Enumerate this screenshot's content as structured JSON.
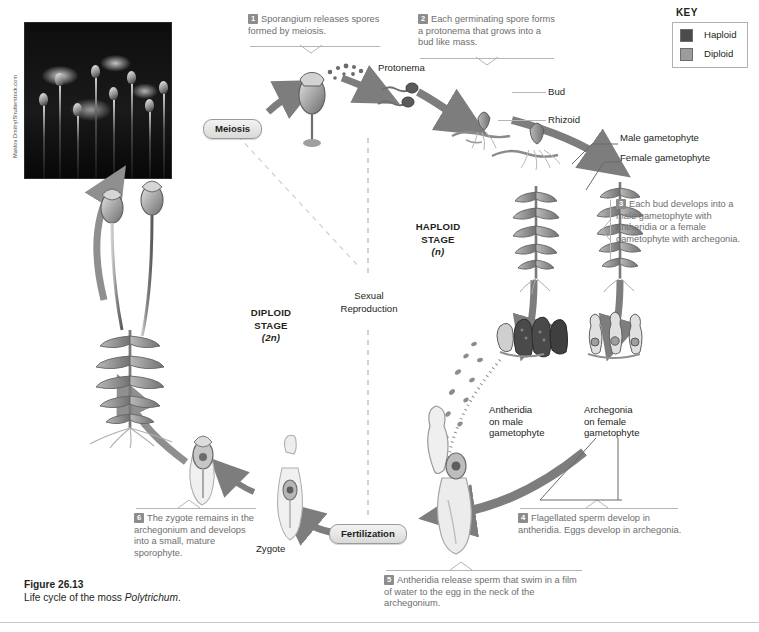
{
  "figure": {
    "number": "Figure 26.13",
    "caption_prefix": "Life cycle of the moss ",
    "caption_species": "Polytrichum",
    "caption_suffix": "."
  },
  "photo": {
    "credit": "Maslov Dmitry/Shutterstock.com",
    "alt_name": "moss-photograph"
  },
  "key": {
    "title": "KEY",
    "items": [
      {
        "label": "Haploid",
        "color": "#4b4b4b"
      },
      {
        "label": "Diploid",
        "color": "#9c9c9c"
      }
    ]
  },
  "stages": {
    "haploid": {
      "line1": "HAPLOID",
      "line2": "STAGE",
      "line3": "(n)"
    },
    "diploid": {
      "line1": "DIPLOID",
      "line2": "STAGE",
      "line3": "(2n)"
    },
    "sexual_reproduction": {
      "line1": "Sexual",
      "line2": "Reproduction"
    }
  },
  "processes": {
    "meiosis": "Meiosis",
    "fertilization": "Fertilization"
  },
  "steps": [
    {
      "number": "1",
      "text": "Sporangium releases spores formed by meiosis."
    },
    {
      "number": "2",
      "text": "Each germinating spore forms a protonema that grows into a bud like mass."
    },
    {
      "number": "3",
      "text": "Each bud develops into a male gametophyte with antheridia or a female gametophyte with archegonia."
    },
    {
      "number": "4",
      "text": "Flagellated sperm develop in antheridia. Eggs develop in archegonia."
    },
    {
      "number": "5",
      "text": "Antheridia release sperm that swim in a film of water to the egg in the neck of the archegonium."
    },
    {
      "number": "6",
      "text": "The zygote remains in the archegonium and develops into a small, mature sporophyte."
    }
  ],
  "labels": {
    "protonema": "Protonema",
    "bud": "Bud",
    "rhizoid": "Rhizoid",
    "male_gametophyte": "Male gametophyte",
    "female_gametophyte": "Female gametophyte",
    "antheridia": "Antheridia\non male\ngametophyte",
    "antheridia_l1": "Antheridia",
    "antheridia_l2": "on male",
    "antheridia_l3": "gametophyte",
    "archegonia_l1": "Archegonia",
    "archegonia_l2": "on female",
    "archegonia_l3": "gametophyte",
    "zygote": "Zygote"
  },
  "colors": {
    "haploid": "#4b4b4b",
    "diploid": "#9c9c9c",
    "callout_text": "#6e6e6e",
    "arrow": "#7d7d7d",
    "leader": "#b5b5b5"
  }
}
